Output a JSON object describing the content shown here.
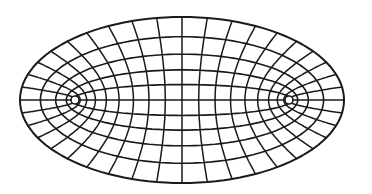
{
  "diagram": {
    "type": "elliptic-coordinate-grid",
    "center": [
      182,
      100
    ],
    "stroke_color": "#1a1a1a",
    "background": "#ffffff",
    "outer_ellipse": {
      "rx": 162,
      "ry": 83
    },
    "ellipses_mu": [
      0.22,
      0.42,
      0.62,
      0.82,
      1.02
    ],
    "hyperbola_count_per_half": 8,
    "foci": [
      {
        "x": 73,
        "y": 101
      },
      {
        "x": 287,
        "y": 99
      }
    ]
  }
}
